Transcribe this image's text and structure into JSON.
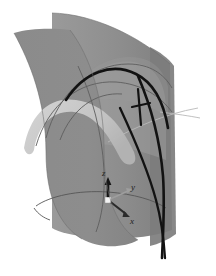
{
  "figure": {
    "canvas": {
      "width": 216,
      "height": 276,
      "background": "#ffffff"
    },
    "axes_triad": {
      "name": "coordinate-axes-triad",
      "origin": {
        "x": 108,
        "y": 200
      },
      "labels": {
        "z": "z",
        "y": "y",
        "x": "x"
      },
      "z_axis": {
        "label": "z",
        "tip": {
          "x": 108,
          "y": 180
        },
        "label_pos": {
          "x": 104,
          "y": 175
        },
        "color": "#181818"
      },
      "y_axis": {
        "label": "y",
        "tip": {
          "x": 130,
          "y": 191
        },
        "label_pos": {
          "x": 132,
          "y": 190
        },
        "color": "#9a9a9a"
      },
      "x_axis": {
        "label": "x",
        "tip": {
          "x": 128,
          "y": 216
        },
        "label_pos": {
          "x": 130,
          "y": 221
        },
        "color": "#303030"
      },
      "origin_marker_color": "#f2f2f2"
    },
    "surfaces": [
      {
        "name": "back-vertical-sheet",
        "role": "rear cylindrical sheet",
        "fill": "#8c8c8c",
        "opacity": 1.0
      },
      {
        "name": "front-left-curved-sheet",
        "role": "front cylindrical sheet",
        "fill": "#898989",
        "opacity": 1.0
      },
      {
        "name": "right-vertical-sheet",
        "role": "right vertical sheet",
        "fill": "#7e7e7e",
        "opacity": 0.9
      },
      {
        "name": "light-ribbon-surface",
        "role": "light tapering ribbon",
        "fill": "#c9c9c9",
        "opacity": 0.95
      },
      {
        "name": "inner-dome-sheet",
        "role": "inner translucent dome",
        "fill": "#9b9b9b",
        "opacity": 0.55
      }
    ],
    "curves": [
      {
        "name": "thick-black-arc",
        "stroke": "#111111",
        "width": 2.6,
        "role": "primary geodesic arc"
      },
      {
        "name": "thick-black-descending-curve-a",
        "stroke": "#111111",
        "width": 2.6,
        "role": "descending geodesic"
      },
      {
        "name": "thick-black-descending-curve-b",
        "stroke": "#111111",
        "width": 2.2,
        "role": "second descending geodesic"
      },
      {
        "name": "black-tick-marker",
        "stroke": "#111111",
        "width": 2.2,
        "role": "intersection tick mark"
      },
      {
        "name": "thin-gray-arc-upper",
        "stroke": "#5a5a5a",
        "width": 0.9,
        "role": "surface boundary curve"
      },
      {
        "name": "thin-gray-arc-lower",
        "stroke": "#5a5a5a",
        "width": 0.9,
        "role": "surface boundary curve"
      },
      {
        "name": "thin-gray-base-ellipse",
        "stroke": "#555555",
        "width": 0.9,
        "role": "cylinder base rim"
      },
      {
        "name": "thin-gray-ray-right",
        "stroke": "#b5b5b5",
        "width": 0.9,
        "role": "extended ray"
      }
    ],
    "palette": {
      "surface_mid_gray": "#8c8c8c",
      "surface_dark_gray": "#7e7e7e",
      "ribbon_light_gray": "#c9c9c9",
      "curve_black": "#111111",
      "curve_gray": "#5a5a5a",
      "background_white": "#ffffff"
    }
  }
}
